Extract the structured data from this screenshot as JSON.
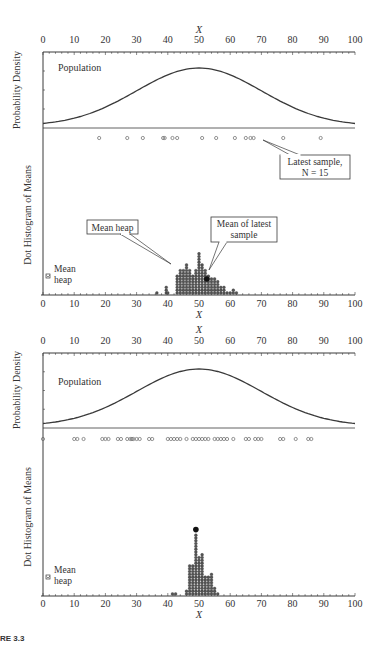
{
  "figure": {
    "caption_fragment": "RE 3.3"
  },
  "chart_data": [
    {
      "type": "scatter",
      "title": "Dance of the means – simulation snapshot (N = 15)",
      "xlabel": "X",
      "ylabel_top": "Probability Density",
      "ylabel_bottom": "Dot Histogram of Means",
      "xlim": [
        0,
        100
      ],
      "xticks": [
        0,
        10,
        20,
        30,
        40,
        50,
        60,
        70,
        80,
        90,
        100
      ],
      "population": {
        "label": "Population",
        "distribution": "normal",
        "mean": 50,
        "sd": 20
      },
      "latest_sample": {
        "label": "Latest sample,",
        "n_label": "N = 15",
        "values": [
          18,
          27,
          32,
          38.5,
          39,
          41.5,
          43,
          51,
          55.5,
          61.5,
          65,
          66.5,
          67.5,
          77,
          89
        ]
      },
      "mean_heap": {
        "label": "Mean heap",
        "bin_centers": [
          36.5,
          39.5,
          40,
          43,
          44,
          45,
          46,
          47,
          48,
          49,
          50,
          51,
          52,
          53,
          54,
          55,
          56,
          57,
          58,
          59,
          60,
          61,
          62
        ],
        "counts": [
          1,
          3,
          1,
          7,
          9,
          9,
          11,
          9,
          7,
          9,
          15,
          11,
          9,
          7,
          6,
          6,
          5,
          3,
          3,
          1,
          1,
          2,
          1
        ]
      },
      "latest_mean": {
        "label": "Mean of latest sample",
        "label_line1": "Mean of latest",
        "label_line2": "sample",
        "value": 52.5,
        "stack_position": 5
      },
      "mean_heap_legend": {
        "line1": "Mean",
        "line2": "heap"
      },
      "callout_mean_heap": "Mean heap"
    },
    {
      "type": "scatter",
      "xlabel": "X",
      "ylabel_top": "Probability Density",
      "ylabel_bottom": "Dot Histogram of Means",
      "xlim": [
        0,
        100
      ],
      "xticks": [
        0,
        10,
        20,
        30,
        40,
        50,
        60,
        70,
        80,
        90,
        100
      ],
      "population": {
        "label": "Population",
        "distribution": "normal",
        "mean": 50,
        "sd": 20
      },
      "accumulated_samples": {
        "values": [
          0,
          10,
          11,
          13,
          19,
          20,
          21,
          24,
          25,
          27,
          28,
          28.5,
          29,
          30,
          31,
          34,
          35,
          40,
          41,
          42,
          43,
          44,
          46,
          48,
          49,
          50,
          51,
          52,
          53,
          55,
          56,
          57,
          58,
          59,
          61,
          65,
          66,
          68,
          69,
          70,
          76,
          77,
          81,
          85,
          86
        ]
      },
      "mean_heap": {
        "label": "Mean heap",
        "bin_centers": [
          41.5,
          42.5,
          46,
          47,
          48,
          49,
          50,
          51,
          52,
          53,
          54,
          55,
          56
        ],
        "counts": [
          1,
          1,
          2,
          11,
          11,
          22,
          14,
          15,
          7,
          7,
          8,
          3,
          1
        ]
      },
      "latest_mean": {
        "value": 49,
        "stack_position": 23
      },
      "mean_heap_legend": {
        "line1": "Mean",
        "line2": "heap"
      }
    }
  ]
}
